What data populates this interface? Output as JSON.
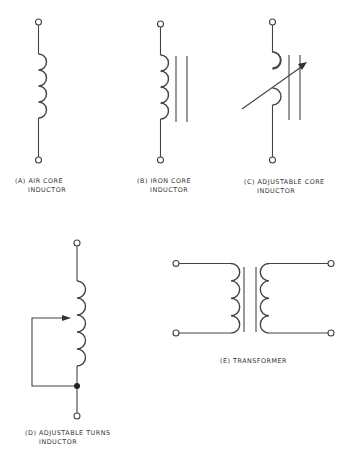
{
  "diagrams": [
    {
      "id": "A",
      "line1": "(A) AIR CORE",
      "line2": "INDUCTOR"
    },
    {
      "id": "B",
      "line1": "(B) IRON CORE",
      "line2": "INDUCTOR"
    },
    {
      "id": "C",
      "line1": "(C) ADJUSTABLE CORE",
      "line2": "INDUCTOR"
    },
    {
      "id": "D",
      "line1": "(D) ADJUSTABLE TURNS",
      "line2": "INDUCTOR"
    },
    {
      "id": "E",
      "line1": "(E) TRANSFORMER",
      "line2": ""
    }
  ],
  "colors": {
    "stroke": "#444444",
    "text": "#333333",
    "background": "#ffffff"
  }
}
